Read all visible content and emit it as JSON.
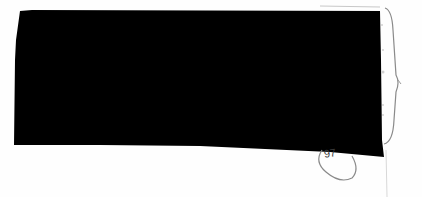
{
  "document": {
    "type": "scanned-page-fragment",
    "redaction": {
      "color": "#000000",
      "description": "large black redaction block covering text"
    },
    "annotations": {
      "page_number": "97",
      "page_number_circled": true,
      "right_margin_bracket": true
    },
    "colors": {
      "paper": "#fefefe",
      "ink": "#8a8a8a",
      "redaction": "#000000"
    }
  }
}
